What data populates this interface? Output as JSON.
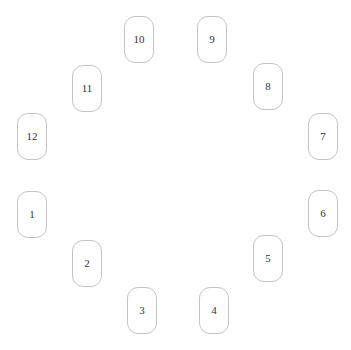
{
  "diagram": {
    "type": "circular-arrangement",
    "nodes": [
      {
        "id": "node-1",
        "label": "1"
      },
      {
        "id": "node-2",
        "label": "2"
      },
      {
        "id": "node-3",
        "label": "3"
      },
      {
        "id": "node-4",
        "label": "4"
      },
      {
        "id": "node-5",
        "label": "5"
      },
      {
        "id": "node-6",
        "label": "6"
      },
      {
        "id": "node-7",
        "label": "7"
      },
      {
        "id": "node-8",
        "label": "8"
      },
      {
        "id": "node-9",
        "label": "9"
      },
      {
        "id": "node-10",
        "label": "10"
      },
      {
        "id": "node-11",
        "label": "11"
      },
      {
        "id": "node-12",
        "label": "12"
      }
    ],
    "colors": {
      "border": "#c4c4c4",
      "text": "#333333",
      "background": "#ffffff"
    }
  }
}
